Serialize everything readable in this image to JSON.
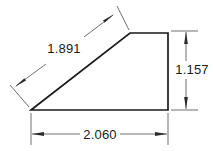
{
  "drawing": {
    "title": "Wedge profile dimensioned drawing",
    "background_color": "#ffffff",
    "line_color": "#1a1a1a",
    "dimension_line_color": "#4a4a4a",
    "text_color": "#1a1a1a"
  },
  "shape": {
    "name": "right-trapezoid-wedge",
    "vertices": "31,110 168,110 168,33 130,33",
    "fill": "#ffffff"
  },
  "dimensions": {
    "hypotenuse": {
      "label": "1.891",
      "orientation": "diagonal",
      "text_x": 64,
      "text_y": 53
    },
    "vertical_right": {
      "label": "1.157",
      "orientation": "vertical",
      "text_x": 192,
      "text_y": 74
    },
    "horizontal_base": {
      "label": "2.060",
      "orientation": "horizontal",
      "text_x": 100,
      "text_y": 139
    }
  }
}
